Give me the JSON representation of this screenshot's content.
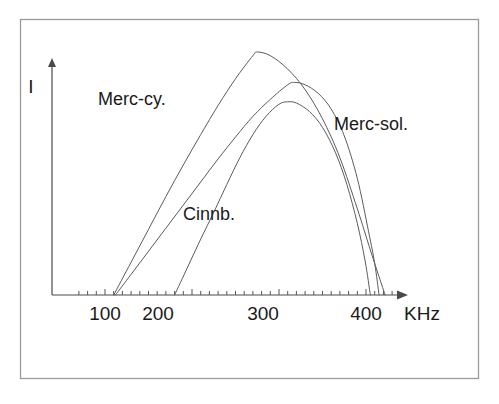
{
  "figure": {
    "background_color": "#ffffff",
    "frame_color": "#9a9a9a",
    "axis_color": "#4a4a4a",
    "curve_color": "#5b5b5b",
    "text_color": "#1a1a1a"
  },
  "chart_data": {
    "type": "line",
    "title": "",
    "subtitle": "",
    "xlabel": "KHz",
    "ylabel": "I",
    "xlim": [
      60,
      460
    ],
    "ylim": [
      0,
      1.05
    ],
    "grid": false,
    "legend": "inline-annotations",
    "x_ticks_major": [
      100,
      200,
      300,
      400
    ],
    "x_tick_labels": [
      "100",
      "200",
      "300",
      "400"
    ],
    "x_tick_minor_step": 10,
    "y_ticks": [],
    "y_tick_labels": [],
    "axis_style": "arrow-ended",
    "series": [
      {
        "name": "Merc-cy.",
        "label": "Merc-cy.",
        "onset_khz": 110,
        "peak_khz": 275,
        "peak_value": 1.0,
        "end_khz": 422,
        "x": [
          110,
          130,
          150,
          170,
          190,
          210,
          230,
          250,
          270,
          275,
          290,
          310,
          330,
          350,
          370,
          390,
          405,
          415,
          422
        ],
        "y": [
          0.0,
          0.135,
          0.27,
          0.405,
          0.535,
          0.66,
          0.78,
          0.89,
          0.985,
          1.0,
          0.985,
          0.93,
          0.845,
          0.725,
          0.565,
          0.355,
          0.185,
          0.075,
          0.0
        ]
      },
      {
        "name": "Merc-sol.",
        "label": "Merc-sol.",
        "onset_khz": 112,
        "peak_khz": 318,
        "peak_value": 0.875,
        "end_khz": 415,
        "x": [
          112,
          130,
          150,
          170,
          190,
          210,
          230,
          250,
          270,
          290,
          310,
          318,
          330,
          345,
          360,
          375,
          390,
          403,
          410,
          415
        ],
        "y": [
          0.0,
          0.085,
          0.18,
          0.275,
          0.37,
          0.465,
          0.56,
          0.65,
          0.735,
          0.805,
          0.865,
          0.875,
          0.865,
          0.83,
          0.765,
          0.655,
          0.48,
          0.26,
          0.13,
          0.0
        ]
      },
      {
        "name": "Cinnb.",
        "label": "Cinnb.",
        "onset_khz": 180,
        "peak_khz": 310,
        "peak_value": 0.795,
        "end_khz": 405,
        "x": [
          180,
          195,
          210,
          225,
          240,
          255,
          270,
          285,
          300,
          310,
          320,
          335,
          350,
          365,
          378,
          390,
          399,
          405
        ],
        "y": [
          0.0,
          0.115,
          0.23,
          0.34,
          0.455,
          0.565,
          0.66,
          0.735,
          0.785,
          0.795,
          0.79,
          0.755,
          0.69,
          0.585,
          0.455,
          0.295,
          0.14,
          0.0
        ]
      }
    ],
    "annotations": [
      {
        "text": "Merc-cy.",
        "x_px": 98,
        "y_px": 105
      },
      {
        "text": "Merc-sol.",
        "x_px": 334,
        "y_px": 130
      },
      {
        "text": "Cinnb.",
        "x_px": 183,
        "y_px": 220
      }
    ]
  }
}
